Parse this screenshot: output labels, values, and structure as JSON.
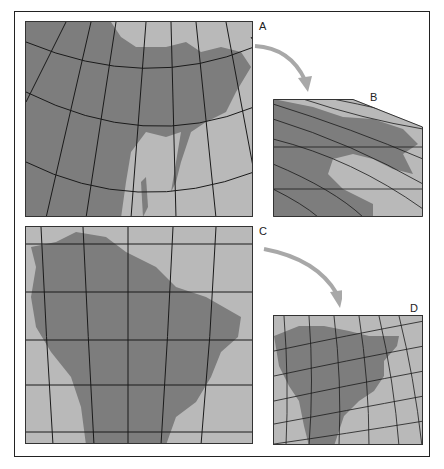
{
  "figure": {
    "panels": [
      {
        "id": "A",
        "label": "A",
        "subject": "East Asia map, conic projection"
      },
      {
        "id": "B",
        "label": "B",
        "subject": "East Asia map, transformed/skewed projection"
      },
      {
        "id": "C",
        "label": "C",
        "subject": "South America map, cylindrical projection"
      },
      {
        "id": "D",
        "label": "D",
        "subject": "South America map, transformed curved projection"
      }
    ],
    "arrows": [
      {
        "from": "A",
        "to": "B"
      },
      {
        "from": "C",
        "to": "D"
      }
    ],
    "colors": {
      "ocean": "#b9b9b9",
      "land": "#7d7d7d",
      "graticule": "#1a1a1a",
      "arrow": "#a8a8a8",
      "frame": "#222222"
    }
  }
}
